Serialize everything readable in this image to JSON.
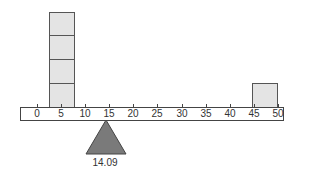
{
  "diagram": {
    "type": "balance-beam",
    "ruler": {
      "ticks": [
        {
          "value": 0,
          "label": "0"
        },
        {
          "value": 5,
          "label": "5"
        },
        {
          "value": 10,
          "label": "10"
        },
        {
          "value": 15,
          "label": "15"
        },
        {
          "value": 20,
          "label": "20"
        },
        {
          "value": 25,
          "label": "25"
        },
        {
          "value": 30,
          "label": "30"
        },
        {
          "value": 35,
          "label": "35"
        },
        {
          "value": 40,
          "label": "40"
        },
        {
          "value": 45,
          "label": "45"
        },
        {
          "value": 50,
          "label": "50"
        }
      ]
    },
    "weights": [
      {
        "position_from": 2.5,
        "position_to": 7.5,
        "count": 4
      },
      {
        "position_from": 45,
        "position_to": 50,
        "count": 1
      }
    ],
    "fulcrum": {
      "position": 14.09,
      "label": "14.09"
    },
    "colors": {
      "box_fill": "#e4e4e4",
      "box_border": "#555555",
      "fulcrum_fill": "#7a7a7a",
      "line": "#444444"
    }
  }
}
